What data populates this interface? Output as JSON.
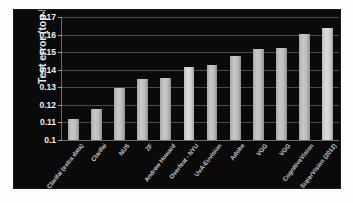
{
  "figure": {
    "background_color": "#0a0a0a",
    "bar_color": "#c9c9c9",
    "grid_color": "#4a4a4a",
    "axis_color": "#6e6e6e"
  },
  "chart_data": {
    "type": "bar",
    "title": "",
    "xlabel": "",
    "ylabel": "Test error (top-5)",
    "ylim": [
      0.1,
      0.17
    ],
    "yticks": [
      "0.1",
      "0.11",
      "0.12",
      "0.13",
      "0.14",
      "0.15",
      "0.16",
      "0.17"
    ],
    "ytick_values": [
      0.1,
      0.11,
      0.12,
      0.13,
      0.14,
      0.15,
      0.16,
      0.17
    ],
    "grid": true,
    "legend": "none",
    "categories": [
      "Clarifai (extra data)",
      "Clarifai",
      "NUS",
      "ZF",
      "Andrew Howard",
      "Overfeat - NYU",
      "UvA-Euvision",
      "Adobe",
      "VGG",
      "VGG",
      "CognitiveVision",
      "SuperVision (2012)"
    ],
    "values": [
      0.112,
      0.1175,
      0.1295,
      0.135,
      0.1355,
      0.1415,
      0.1425,
      0.148,
      0.152,
      0.1525,
      0.1605,
      0.1635
    ],
    "highlight_indices": [
      5,
      11
    ]
  }
}
